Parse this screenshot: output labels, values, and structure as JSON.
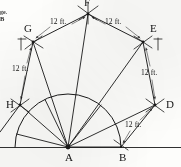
{
  "figure": {
    "ink_color": "#1a1a1a",
    "paper_color": "#fdfdfb",
    "width": 181,
    "height": 167
  },
  "margin_text": {
    "fragment": "ge.",
    "letter": "B"
  },
  "vertices": [
    {
      "id": "A",
      "label": "A",
      "x": 68,
      "y": 147,
      "label_x": 65,
      "label_y": 152
    },
    {
      "id": "B",
      "label": "B",
      "x": 121,
      "y": 147,
      "label_x": 119,
      "label_y": 152
    },
    {
      "id": "D",
      "label": "D",
      "x": 155,
      "y": 105,
      "label_x": 166,
      "label_y": 99
    },
    {
      "id": "E",
      "label": "E",
      "x": 143,
      "y": 42,
      "label_x": 150,
      "label_y": 23
    },
    {
      "id": "F",
      "label": "F",
      "x": 88,
      "y": 14,
      "label_x": 84,
      "label_y": -3
    },
    {
      "id": "G",
      "label": "G",
      "x": 33,
      "y": 42,
      "label_x": 24,
      "label_y": 23
    },
    {
      "id": "H",
      "label": "H",
      "x": 20,
      "y": 105,
      "label_x": 6,
      "label_y": 99
    }
  ],
  "dimensions": [
    {
      "id": "dim-fg",
      "text": "12 ft.",
      "x": 50,
      "y": 21
    },
    {
      "id": "dim-fe",
      "text": "12 ft.",
      "x": 105,
      "y": 21
    },
    {
      "id": "dim-gh",
      "text": "12 ft.",
      "x": 12,
      "y": 68
    },
    {
      "id": "dim-ed",
      "text": "12 ft.",
      "x": 143,
      "y": 72
    },
    {
      "id": "dim-db",
      "text": "12 ft.",
      "x": 127,
      "y": 124
    }
  ],
  "geometry": {
    "arc": {
      "center_x": 68,
      "center_y": 147,
      "radius": 53,
      "description": "semicircular arc from B around to the left baseline end"
    },
    "baseline": {
      "x1": 0,
      "y1": 147,
      "x2": 181,
      "y2": 147
    },
    "radial_count": 9,
    "description": "Radii fan out from A to the arc and beyond to the outer polygon vertices"
  }
}
